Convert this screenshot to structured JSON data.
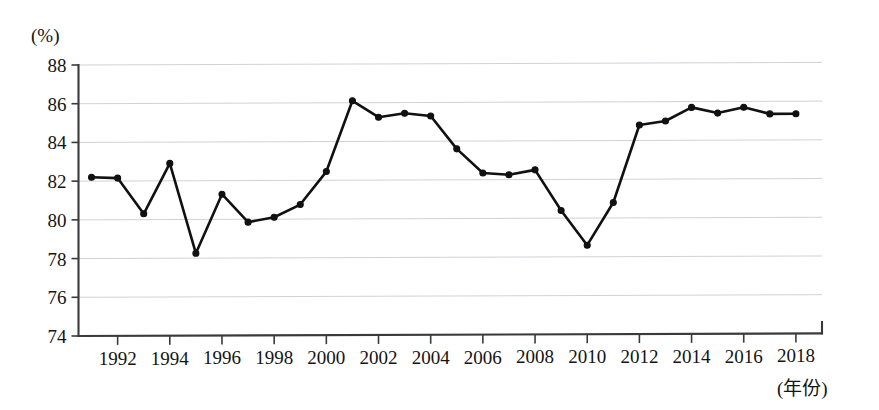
{
  "chart_data": {
    "type": "line",
    "title": "",
    "xlabel": "(年份)",
    "ylabel": "(%)",
    "x": [
      1991,
      1992,
      1993,
      1994,
      1995,
      1996,
      1997,
      1998,
      1999,
      2000,
      2001,
      2002,
      2003,
      2004,
      2005,
      2006,
      2007,
      2008,
      2009,
      2010,
      2011,
      2012,
      2013,
      2014,
      2015,
      2016,
      2017,
      2018
    ],
    "values": [
      82.2,
      82.15,
      80.3,
      82.9,
      78.25,
      81.3,
      79.85,
      80.1,
      80.75,
      82.45,
      86.1,
      85.25,
      85.45,
      85.3,
      83.6,
      82.35,
      82.25,
      82.5,
      80.4,
      78.6,
      80.8,
      84.8,
      85.0,
      85.7,
      85.4,
      85.7,
      85.35,
      85.35
    ],
    "series": [
      {
        "name": "",
        "values": [
          82.2,
          82.15,
          80.3,
          82.9,
          78.25,
          81.3,
          79.85,
          80.1,
          80.75,
          82.45,
          86.1,
          85.25,
          85.45,
          85.3,
          83.6,
          82.35,
          82.25,
          82.5,
          80.4,
          78.6,
          80.8,
          84.8,
          85.0,
          85.7,
          85.4,
          85.7,
          85.35,
          85.35
        ],
        "color": "#111111"
      }
    ],
    "ylim": [
      74,
      88
    ],
    "yticks": [
      74,
      76,
      78,
      80,
      82,
      84,
      86,
      88
    ],
    "ytick_labels": [
      "74",
      "76",
      "78",
      "80",
      "82",
      "84",
      "86",
      "88"
    ],
    "xlim": [
      1990.5,
      2019.0
    ],
    "xticks": [
      1992,
      1994,
      1996,
      1998,
      2000,
      2002,
      2004,
      2006,
      2008,
      2010,
      2012,
      2014,
      2016,
      2018
    ],
    "xtick_labels": [
      "1992",
      "1994",
      "1996",
      "1998",
      "2000",
      "2002",
      "2004",
      "2006",
      "2008",
      "2010",
      "2012",
      "2014",
      "2016",
      "2018"
    ],
    "grid": true,
    "grid_axis": "y",
    "legend": false,
    "legend_position": "none",
    "marker": "circle",
    "line_color": "#111111",
    "grid_color": "#c9cdd4",
    "axis_color": "#3a3a3a",
    "background": "#ffffff"
  },
  "axes": {
    "y_unit": "(%)",
    "x_unit": "(年份)"
  }
}
